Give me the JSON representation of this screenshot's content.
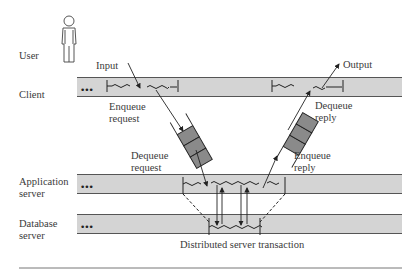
{
  "diagram": {
    "lanes": [
      {
        "id": "user",
        "label": "User"
      },
      {
        "id": "client",
        "label": "Client"
      },
      {
        "id": "app",
        "label_line1": "Application",
        "label_line2": "server"
      },
      {
        "id": "db",
        "label_line1": "Database",
        "label_line2": "server"
      }
    ],
    "annotations": {
      "input": "Input",
      "output": "Output",
      "enqueue_request_1": "Enqueue",
      "enqueue_request_2": "request",
      "dequeue_reply_1": "Dequeue",
      "dequeue_reply_2": "reply",
      "dequeue_request_1": "Dequeue",
      "dequeue_request_2": "request",
      "enqueue_reply_1": "Enqueue",
      "enqueue_reply_2": "reply"
    },
    "caption": "Distributed server transaction",
    "ellipsis": "•••",
    "colors": {
      "band": "#d4d4d4",
      "band_border": "#555555",
      "queue_cell": "#8a8a8a",
      "line": "#222222"
    }
  }
}
